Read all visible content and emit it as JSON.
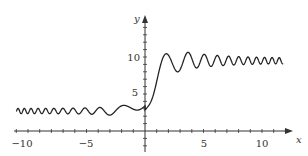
{
  "chart_data": {
    "type": "line",
    "title": "",
    "xlabel": "x",
    "ylabel": "y",
    "xlim": [
      -11,
      12
    ],
    "ylim": [
      -2,
      17
    ],
    "grid": false,
    "legend": null,
    "x_ticks": [
      -10,
      -5,
      5,
      10
    ],
    "x_tick_labels": [
      "−10",
      "−5",
      "5",
      "10"
    ],
    "y_ticks": [
      5,
      10
    ],
    "y_tick_labels": [
      "5",
      "10"
    ],
    "series": [
      {
        "name": "f(x)",
        "description": "Small oscillations around y≈2.7 for x<-3 growing in amplitude toward x≈0, rising through y≈5 near x=0, overshooting to ~12.3 at x≈2, then damped oscillations settling around y≈9.5 for large x",
        "x": [
          -11,
          -8,
          -5,
          -3,
          -2,
          -1.2,
          -0.5,
          0,
          0.5,
          1,
          1.5,
          2,
          2.6,
          3.2,
          4,
          5,
          7,
          9,
          11,
          12
        ],
        "y": [
          2.7,
          2.7,
          2.7,
          3.0,
          4.0,
          2.0,
          4.0,
          5.0,
          5.2,
          7.5,
          10.5,
          12.3,
          8.5,
          11.3,
          8.8,
          10.5,
          9.2,
          9.8,
          9.4,
          9.5
        ]
      }
    ]
  },
  "labels": {
    "x_axis": "x",
    "y_axis": "y",
    "tick_neg10": "−10",
    "tick_neg5": "−5",
    "tick_5": "5",
    "tick_10": "10",
    "ytick_5": "5",
    "ytick_10": "10"
  },
  "colors": {
    "curve": "#222222",
    "axes": "#333333"
  }
}
